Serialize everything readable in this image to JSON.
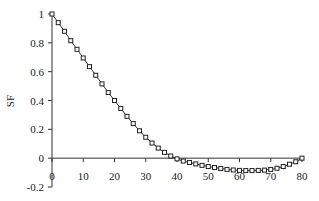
{
  "chart_data": {
    "type": "line",
    "title": "",
    "xlabel": "",
    "ylabel": "SF",
    "xlim": [
      0,
      80
    ],
    "ylim": [
      -0.2,
      1
    ],
    "x_ticks": [
      0,
      10,
      20,
      30,
      40,
      50,
      60,
      70,
      80
    ],
    "y_ticks": [
      -0.2,
      0,
      0.2,
      0.4,
      0.6,
      0.8,
      1
    ],
    "y_tick_labels": [
      "-0.2",
      "0",
      "0.2",
      "0.4",
      "0.6",
      "0.8",
      "1"
    ],
    "x_tick_labels": [
      "0",
      "10",
      "20",
      "30",
      "40",
      "50",
      "60",
      "70",
      "80"
    ],
    "grid": false,
    "legend": null,
    "marker": "square",
    "series": [
      {
        "name": "SF",
        "x": [
          0,
          2,
          4,
          6,
          8,
          10,
          12,
          14,
          16,
          18,
          20,
          22,
          24,
          26,
          28,
          30,
          32,
          34,
          36,
          38,
          40,
          42,
          44,
          46,
          48,
          50,
          52,
          54,
          56,
          58,
          60,
          62,
          64,
          66,
          68,
          70,
          72,
          74,
          76,
          78,
          80
        ],
        "values": [
          1.0,
          0.94,
          0.88,
          0.815,
          0.755,
          0.695,
          0.635,
          0.575,
          0.515,
          0.455,
          0.4,
          0.345,
          0.29,
          0.24,
          0.19,
          0.145,
          0.105,
          0.07,
          0.04,
          0.015,
          -0.005,
          -0.02,
          -0.03,
          -0.04,
          -0.05,
          -0.058,
          -0.065,
          -0.072,
          -0.078,
          -0.082,
          -0.085,
          -0.086,
          -0.086,
          -0.085,
          -0.083,
          -0.078,
          -0.07,
          -0.058,
          -0.042,
          -0.025,
          0.0
        ]
      }
    ]
  },
  "axes": {
    "ylabel": "SF"
  }
}
